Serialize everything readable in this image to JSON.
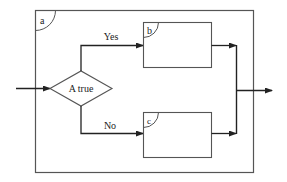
{
  "diagram": {
    "type": "flowchart-selection",
    "outer_block": {
      "label": "a"
    },
    "decision": {
      "label": "A true"
    },
    "branches": [
      {
        "label": "Yes",
        "target_block": "b"
      },
      {
        "label": "No",
        "target_block": "c"
      }
    ],
    "blocks": [
      {
        "id": "b",
        "label": "b"
      },
      {
        "id": "c",
        "label": "c"
      }
    ],
    "colors": {
      "line": "#555555",
      "flow": "#222222",
      "background": "#ffffff"
    }
  }
}
